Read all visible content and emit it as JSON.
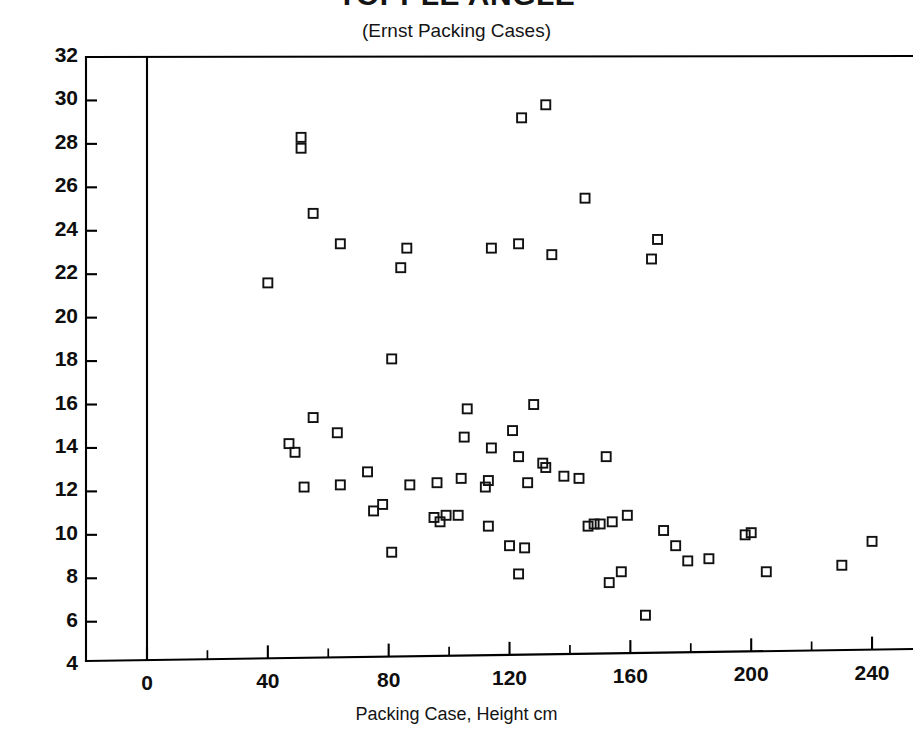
{
  "chart_data": {
    "type": "scatter",
    "title": "TOPPLE ANGLE",
    "subtitle": "(Ernst Packing Cases)",
    "xlabel": "Packing Case, Height cm",
    "ylabel": "",
    "xlim": [
      -10,
      255
    ],
    "ylim": [
      4,
      32
    ],
    "grid": false,
    "legend": "none",
    "marker": "open-square",
    "x_ticks_major": [
      0,
      40,
      80,
      120,
      160,
      200,
      240
    ],
    "x_ticks_minor": [
      20,
      60,
      100,
      140,
      180,
      220
    ],
    "y_ticks_major": [
      4,
      6,
      8,
      10,
      12,
      14,
      16,
      18,
      20,
      22,
      24,
      26,
      28,
      30,
      32
    ],
    "x_tick_labels": [
      "0",
      "40",
      "80",
      "120",
      "160",
      "200",
      "240"
    ],
    "y_tick_labels": [
      "4",
      "6",
      "8",
      "10",
      "12",
      "14",
      "16",
      "18",
      "20",
      "22",
      "24",
      "26",
      "28",
      "30",
      "32"
    ],
    "points": [
      [
        40,
        21.6
      ],
      [
        51,
        28.3
      ],
      [
        51,
        27.8
      ],
      [
        55,
        24.8
      ],
      [
        64,
        23.4
      ],
      [
        84,
        22.3
      ],
      [
        86,
        23.2
      ],
      [
        114,
        23.2
      ],
      [
        123,
        23.4
      ],
      [
        124,
        29.2
      ],
      [
        132,
        29.8
      ],
      [
        134,
        22.9
      ],
      [
        145,
        25.5
      ],
      [
        167,
        22.7
      ],
      [
        169,
        23.6
      ],
      [
        81,
        18.1
      ],
      [
        47,
        14.2
      ],
      [
        49,
        13.8
      ],
      [
        55,
        15.4
      ],
      [
        63,
        14.7
      ],
      [
        52,
        12.2
      ],
      [
        64,
        12.3
      ],
      [
        73,
        12.9
      ],
      [
        87,
        12.3
      ],
      [
        96,
        12.4
      ],
      [
        104,
        12.6
      ],
      [
        105,
        14.5
      ],
      [
        106,
        15.8
      ],
      [
        112,
        12.2
      ],
      [
        113,
        12.5
      ],
      [
        114,
        14.0
      ],
      [
        121,
        14.8
      ],
      [
        123,
        13.6
      ],
      [
        128,
        16.0
      ],
      [
        126,
        12.4
      ],
      [
        131,
        13.3
      ],
      [
        132,
        13.1
      ],
      [
        138,
        12.7
      ],
      [
        143,
        12.6
      ],
      [
        152,
        13.6
      ],
      [
        75,
        11.1
      ],
      [
        78,
        11.4
      ],
      [
        95,
        10.8
      ],
      [
        97,
        10.6
      ],
      [
        99,
        10.9
      ],
      [
        103,
        10.9
      ],
      [
        81,
        9.2
      ],
      [
        113,
        10.4
      ],
      [
        120,
        9.5
      ],
      [
        125,
        9.4
      ],
      [
        123,
        8.2
      ],
      [
        146,
        10.4
      ],
      [
        148,
        10.5
      ],
      [
        150,
        10.5
      ],
      [
        154,
        10.6
      ],
      [
        159,
        10.9
      ],
      [
        153,
        7.8
      ],
      [
        157,
        8.3
      ],
      [
        165,
        6.3
      ],
      [
        171,
        10.2
      ],
      [
        175,
        9.5
      ],
      [
        179,
        8.8
      ],
      [
        186,
        8.9
      ],
      [
        198,
        10.0
      ],
      [
        200,
        10.1
      ],
      [
        205,
        8.3
      ],
      [
        230,
        8.6
      ],
      [
        240,
        9.7
      ]
    ]
  },
  "axes": {
    "y_axis_name": "topple-angle-axis",
    "x_axis_name": "packing-case-height-axis"
  }
}
